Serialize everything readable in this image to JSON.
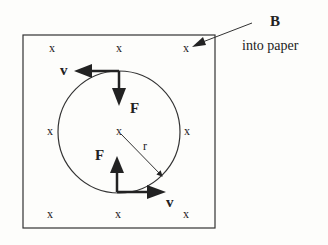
{
  "diagram": {
    "field": {
      "label": "B",
      "description": "into paper"
    },
    "field_markers": [
      {
        "text": "x",
        "x": 52,
        "y": 52
      },
      {
        "text": "x",
        "x": 119,
        "y": 52
      },
      {
        "text": "x",
        "x": 186,
        "y": 52
      },
      {
        "text": "x",
        "x": 50,
        "y": 135
      },
      {
        "text": "x",
        "x": 119,
        "y": 135
      },
      {
        "text": "x",
        "x": 187,
        "y": 135
      },
      {
        "text": "x",
        "x": 50,
        "y": 218
      },
      {
        "text": "x",
        "x": 118,
        "y": 218
      },
      {
        "text": "x",
        "x": 186,
        "y": 218
      }
    ],
    "labels": {
      "velocity_top": "v",
      "force_top": "F",
      "force_bottom": "F",
      "velocity_bottom": "v",
      "radius": "r"
    },
    "colors": {
      "ink": "#222222",
      "background": "#fdfdfb"
    }
  }
}
